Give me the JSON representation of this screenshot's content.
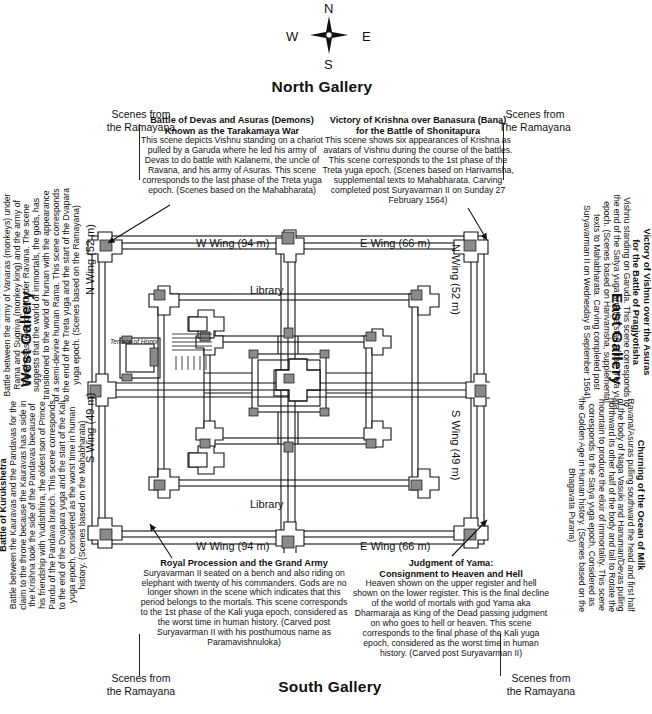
{
  "compass": {
    "north": "N",
    "south": "S",
    "east": "E",
    "west": "W",
    "icon": "compass-rose-icon"
  },
  "galleries": {
    "north": "North Gallery",
    "south": "South Gallery",
    "east": "East Gallery",
    "west": "West Gallery"
  },
  "corner_notes": {
    "top_left": "Scenes from\nthe Ramayana",
    "top_right": "Scenes from\nThe Ramayana",
    "bottom_left": "Scenes from\nthe Ramayana",
    "bottom_right": "Scenes from\nthe Ramayana"
  },
  "panels": {
    "north_west": {
      "title": "Battle of Devas and Asuras (Demons)\nKnown as the Tarakamaya  War",
      "body": "This scene depicts Vishnu standing on a chariot pulled by a Garuda where he led his army of Devas to do battle with Kalanemi, the uncle of Ravana, and his army of Asuras. This scene corresponds to the last phase of the Treta  yuga epoch. (Scenes based on the Mahabharata)"
    },
    "north_east": {
      "title": "Victory of Krishna over Banasura (Bana)\nfor the Battle of  Shonitapura",
      "body": "This scene shows six appearances of Krishna as avatars of Vishnu during the course of the battles. This scene corresponds to the 1st phase of the Treta  yuga epoch. (Scenes based on Harivamsha, supplemental texts to Mahabharata.  Carving completed post Suryavarman II on Sunday 27 February 1564)"
    },
    "south_west": {
      "title": "Royal Procession and the Grand Army",
      "body": "Suryavarman II seated on a bench and also riding on elephant with twenty of his commanders. Gods are no longer shown in the scene which indicates that this period belongs to the mortals. This scene corresponds to the 1st phase of the Kali yuga epoch, considered as the worst time in human history. (Carved post Suryavarman II with his posthumous name as Paramavishnuloka)"
    },
    "south_east": {
      "title": "Judgment of Yama:\nConsignment to Heaven and Hell",
      "body": "Heaven shown on the upper register and hell shown on the lower register. This is the final decline of the world of mortals with god Yama aka Dharmaraja as King of the Dead passing judgment on who goes to hell  or heaven. This scene corresponds to the final phase of the Kali yuga epoch, considered as the worst time in human history. (Carved post Suryavarman II)"
    },
    "west_top": {
      "title": "Battle of Lanka",
      "body": "Battle between the army of Vanaras (monkeys) under Rama and Sugriva (monkey king) and the army of Rakshasas (demons) under Ravana. The scene suggests that the world of immortals, the gods, has transitioned to the world of human with the appearance of a semi-devine human Rama. This scene corresponds to the end of the Treta yuga and the start of the Dvapara yuga epoch. (Scenes based on the Ramayana)"
    },
    "west_bottom": {
      "title": "Battle of Kurukshetra",
      "body": "Battle between the Kauravas and the Pandavas for the claim to the throne because the Kauravas has a side in the Krishna took the side of the Pandavas because of his friendship with Yudishthira, the oldest son of Prince Pandu of the Pandava branch. This scene corresponds to the end of the Dvapara yuga and the start of the Kali yuga epoch, considered as the worst time in human history. (Scenes based on the Mahabharata)"
    },
    "east_top": {
      "title": "Victory of Vishnu over the Asuras\nfor the Battle of Pragjyotisha",
      "body": "Vishnu standing on Garuda. This scene corresponds to the end of the Satya yuga and the start of the Treta yuga epoch. (Scenes based on Harivamsha, supplemental texts to Mahabharata.  Carving completed post Suryavarman II on Wednesday 8 September 1564)"
    },
    "east_bottom": {
      "title": "Churning of the Ocean of Milk",
      "body": "Ravana/Asuras pulling southward the head and first half of the body of Naga Vasuki and Hanuman/Devas pulling northward its other half of the body and tail to Rotate the mountain to produce  the elixir of immortality. This scene corresponds to the Satya yuga epoch, Considered as the Golden Age in Human history. (Scenes based on the Bhagavata Purana)"
    }
  },
  "plan": {
    "wings": {
      "w_wing_top": "W Wing (94 m)",
      "e_wing_top": "E Wing (66 m)",
      "w_wing_bottom": "W Wing (94 m)",
      "e_wing_bottom": "E Wing (66 m)",
      "n_wing_left": "N Wing (52 m)",
      "s_wing_left": "S Wing (49 m)",
      "n_wing_right": "N Wing (52 m)",
      "s_wing_right": "S Wing (49 m)"
    },
    "library_top": "Library",
    "library_bottom": "Library",
    "terrace": "Terrace of Honor"
  },
  "colors": {
    "ink": "#111111",
    "fill_dark": "#808080",
    "paper": "#ffffff"
  }
}
